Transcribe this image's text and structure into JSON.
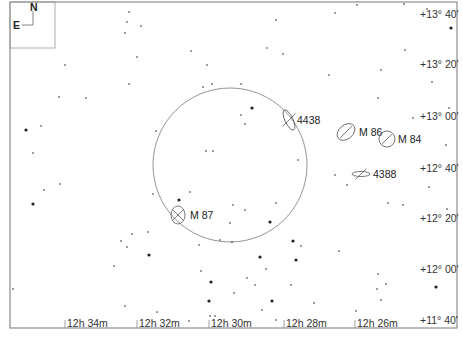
{
  "compass": {
    "north": "N",
    "east": "E"
  },
  "dec_labels": [
    {
      "text": "+13° 40'",
      "y": 18
    },
    {
      "text": "+13° 20'",
      "y": 68
    },
    {
      "text": "+13° 00'",
      "y": 120
    },
    {
      "text": "+12° 40'",
      "y": 172
    },
    {
      "text": "+12° 20'",
      "y": 222
    },
    {
      "text": "+12° 00'",
      "y": 273
    },
    {
      "text": "+11° 40'",
      "y": 324
    }
  ],
  "ra_labels": [
    {
      "text": "12h 34m",
      "x": 65
    },
    {
      "text": "12h 32m",
      "x": 137
    },
    {
      "text": "12h 30m",
      "x": 209
    },
    {
      "text": "12h 28m",
      "x": 284
    },
    {
      "text": "12h 26m",
      "x": 355
    }
  ],
  "field_circle": {
    "cx": 230,
    "cy": 165,
    "r": 77
  },
  "objects": [
    {
      "name": "4438",
      "cx": 289,
      "cy": 120,
      "rx": 4,
      "ry": 11,
      "rot": -25,
      "lx": 297,
      "ly": 124
    },
    {
      "name": "M 86",
      "cx": 346,
      "cy": 132,
      "rx": 10,
      "ry": 7,
      "rot": -40,
      "lx": 359,
      "ly": 136
    },
    {
      "name": "M 84",
      "cx": 387,
      "cy": 139,
      "rx": 8,
      "ry": 8,
      "rot": 0,
      "lx": 398,
      "ly": 143
    },
    {
      "name": "4388",
      "cx": 361,
      "cy": 174,
      "rx": 9,
      "ry": 2.5,
      "rot": 0,
      "lx": 373,
      "ly": 178
    },
    {
      "name": "M 87",
      "cx": 178,
      "cy": 215,
      "rx": 7,
      "ry": 9,
      "rot": 0,
      "lx": 190,
      "ly": 219
    }
  ],
  "stars": [
    [
      129,
      12,
      1
    ],
    [
      127,
      22,
      1
    ],
    [
      141,
      26,
      1
    ],
    [
      125,
      33,
      1
    ],
    [
      357,
      5,
      1
    ],
    [
      404,
      4,
      1
    ],
    [
      427,
      9,
      1
    ],
    [
      335,
      13,
      1
    ],
    [
      276,
      20,
      1
    ],
    [
      451,
      28,
      2
    ],
    [
      191,
      51,
      1
    ],
    [
      267,
      48,
      1
    ],
    [
      405,
      50,
      1
    ],
    [
      137,
      57,
      1
    ],
    [
      207,
      65,
      1
    ],
    [
      65,
      65,
      1
    ],
    [
      283,
      54,
      1
    ],
    [
      329,
      75,
      1
    ],
    [
      381,
      70,
      1
    ],
    [
      432,
      82,
      1
    ],
    [
      129,
      84,
      1
    ],
    [
      203,
      87,
      1
    ],
    [
      212,
      84,
      1
    ],
    [
      241,
      84,
      1
    ],
    [
      59,
      97,
      1
    ],
    [
      86,
      98,
      1
    ],
    [
      378,
      98,
      1
    ],
    [
      449,
      108,
      1
    ],
    [
      252,
      108,
      2
    ],
    [
      241,
      115,
      1
    ],
    [
      245,
      124,
      1
    ],
    [
      26,
      130,
      2
    ],
    [
      41,
      126,
      1
    ],
    [
      156,
      131,
      1
    ],
    [
      413,
      118,
      1
    ],
    [
      33,
      153,
      1
    ],
    [
      206,
      151,
      1
    ],
    [
      213,
      151,
      1
    ],
    [
      298,
      160,
      1
    ],
    [
      446,
      145,
      1
    ],
    [
      335,
      175,
      1
    ],
    [
      347,
      185,
      1
    ],
    [
      429,
      187,
      1
    ],
    [
      60,
      184,
      1
    ],
    [
      44,
      190,
      1
    ],
    [
      153,
      194,
      1
    ],
    [
      33,
      204,
      2
    ],
    [
      190,
      192,
      1
    ],
    [
      179,
      200,
      2
    ],
    [
      233,
      205,
      1
    ],
    [
      245,
      210,
      1
    ],
    [
      276,
      203,
      1
    ],
    [
      388,
      203,
      1
    ],
    [
      403,
      205,
      1
    ],
    [
      447,
      209,
      1
    ],
    [
      230,
      223,
      1
    ],
    [
      270,
      222,
      2
    ],
    [
      132,
      234,
      1
    ],
    [
      148,
      232,
      1
    ],
    [
      121,
      241,
      1
    ],
    [
      127,
      247,
      1
    ],
    [
      199,
      245,
      1
    ],
    [
      220,
      240,
      1
    ],
    [
      232,
      242,
      1
    ],
    [
      293,
      241,
      2
    ],
    [
      301,
      246,
      1
    ],
    [
      339,
      251,
      1
    ],
    [
      149,
      255,
      2
    ],
    [
      260,
      257,
      2
    ],
    [
      296,
      260,
      2
    ],
    [
      114,
      266,
      1
    ],
    [
      201,
      271,
      1
    ],
    [
      266,
      269,
      1
    ],
    [
      378,
      274,
      1
    ],
    [
      386,
      284,
      1
    ],
    [
      211,
      282,
      2
    ],
    [
      247,
      278,
      1
    ],
    [
      255,
      285,
      1
    ],
    [
      291,
      285,
      1
    ],
    [
      377,
      289,
      1
    ],
    [
      436,
      287,
      2
    ],
    [
      13,
      289,
      1
    ],
    [
      234,
      293,
      1
    ],
    [
      209,
      301,
      2
    ],
    [
      272,
      301,
      2
    ],
    [
      314,
      303,
      1
    ],
    [
      125,
      306,
      1
    ],
    [
      381,
      300,
      1
    ],
    [
      157,
      312,
      1
    ],
    [
      262,
      310,
      1
    ],
    [
      356,
      311,
      1
    ],
    [
      189,
      321,
      1
    ],
    [
      210,
      316,
      1
    ],
    [
      215,
      316,
      1
    ],
    [
      276,
      320,
      1
    ]
  ],
  "colors": {
    "ink": "#222222",
    "frame": "#777777",
    "circle": "#888888"
  }
}
